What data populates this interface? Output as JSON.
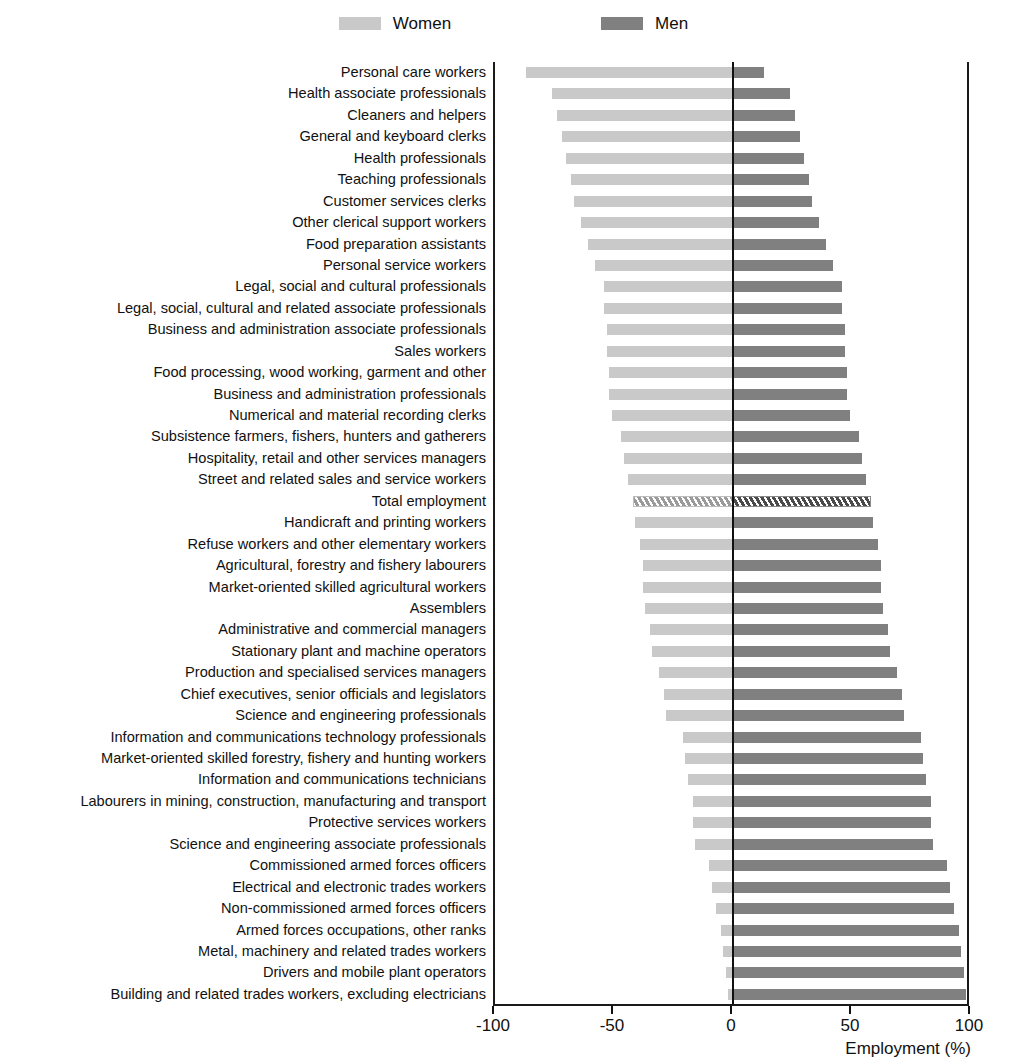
{
  "legend": {
    "entries": [
      {
        "label": "Women",
        "color": "#c9c9c9",
        "swatch": "women-swatch"
      },
      {
        "label": "Men",
        "color": "#808080",
        "swatch": "men-swatch"
      }
    ]
  },
  "axis": {
    "x_title": "Employment (%)",
    "ticks": [
      -100,
      -50,
      0,
      50,
      100
    ],
    "tick_labels": [
      "-100",
      "-50",
      "0",
      "50",
      "100"
    ]
  },
  "chart_data": {
    "type": "bar",
    "orientation": "horizontal",
    "subtype": "diverging-bar",
    "title": "",
    "xlabel": "Employment (%)",
    "ylabel": "",
    "xlim": [
      -100,
      100
    ],
    "grid": false,
    "legend_position": "top-center",
    "series": [
      {
        "name": "Women",
        "color": "#c9c9c9",
        "sign": "negative"
      },
      {
        "name": "Men",
        "color": "#808080",
        "sign": "positive"
      }
    ],
    "categories": [
      "Personal care workers",
      "Health associate professionals",
      "Cleaners and helpers",
      "General and keyboard clerks",
      "Health professionals",
      "Teaching professionals",
      "Customer services clerks",
      "Other clerical support workers",
      "Food preparation assistants",
      "Personal service workers",
      "Legal, social and cultural professionals",
      "Legal, social, cultural and related associate professionals",
      "Business and administration associate professionals",
      "Sales workers",
      "Food processing, wood working, garment and other",
      "Business and administration professionals",
      "Numerical and material recording clerks",
      "Subsistence farmers, fishers, hunters and gatherers",
      "Hospitality, retail and other services managers",
      "Street and related sales and service workers",
      "Total employment",
      "Handicraft and printing workers",
      "Refuse workers and other elementary workers",
      "Agricultural, forestry and fishery labourers",
      "Market-oriented skilled agricultural workers",
      "Assemblers",
      "Administrative and commercial managers",
      "Stationary plant and machine operators",
      "Production and specialised services managers",
      "Chief executives, senior officials and legislators",
      "Science and engineering professionals",
      "Information and communications technology professionals",
      "Market-oriented skilled forestry, fishery and hunting workers",
      "Information and communications technicians",
      "Labourers in mining, construction, manufacturing and transport",
      "Protective services workers",
      "Science and engineering associate professionals",
      "Commissioned armed forces officers",
      "Electrical and electronic trades workers",
      "Non-commissioned armed forces officers",
      "Armed forces occupations, other ranks",
      "Metal, machinery and related trades workers",
      "Drivers and mobile plant operators",
      "Building and related trades workers, excluding electricians"
    ],
    "women_values": [
      -87,
      -76,
      -74,
      -72,
      -70,
      -68,
      -67,
      -64,
      -61,
      -58,
      -54,
      -54,
      -53,
      -53,
      -52,
      -52,
      -51,
      -47,
      -46,
      -44,
      -42,
      -41,
      -39,
      -38,
      -38,
      -37,
      -35,
      -34,
      -31,
      -29,
      -28,
      -21,
      -20,
      -19,
      -17,
      -17,
      -16,
      -10,
      -9,
      -7,
      -5,
      -4,
      -3,
      -2
    ],
    "men_values": [
      13,
      24,
      26,
      28,
      30,
      32,
      33,
      36,
      39,
      42,
      46,
      46,
      47,
      47,
      48,
      48,
      49,
      53,
      54,
      56,
      58,
      59,
      61,
      62,
      62,
      63,
      65,
      66,
      69,
      71,
      72,
      79,
      80,
      81,
      83,
      83,
      84,
      90,
      91,
      93,
      95,
      96,
      97,
      98
    ]
  }
}
